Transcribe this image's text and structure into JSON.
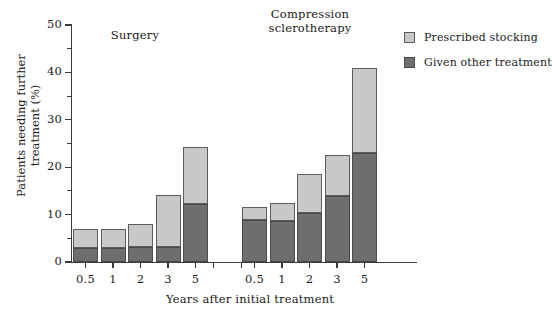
{
  "chart_data": {
    "type": "bar",
    "title": "",
    "subtitle": "",
    "xlabel": "Years after initial treatment",
    "ylabel": "Patients needing\nfurther treatment (%)",
    "ylim": [
      0,
      50
    ],
    "yticks_major": [
      0,
      10,
      20,
      30,
      40,
      50
    ],
    "yticks_minor": [
      5,
      15,
      25,
      35,
      45
    ],
    "grid": false,
    "stacked": true,
    "legend_position": "top-right",
    "legend": [
      {
        "name": "Prescribed stocking",
        "color": "#c8c8c8"
      },
      {
        "name": "Given other treatment",
        "color": "#6e6e6e"
      }
    ],
    "groups": [
      {
        "name": "Surgery",
        "caption": "Surgery",
        "categories": [
          "0.5",
          "1",
          "2",
          "3",
          "5"
        ],
        "series": [
          {
            "name": "Given other treatment",
            "values": [
              3.0,
              3.0,
              3.2,
              3.2,
              12.3
            ]
          },
          {
            "name": "Prescribed stocking",
            "values": [
              4.0,
              4.0,
              4.8,
              10.9,
              12.0
            ]
          }
        ],
        "totals": [
          7.0,
          7.0,
          8.0,
          14.1,
          24.3
        ]
      },
      {
        "name": "Compression sclerotherapy",
        "caption": "Compression\nsclerotherapy",
        "categories": [
          "0.5",
          "1",
          "2",
          "3",
          "5"
        ],
        "series": [
          {
            "name": "Given other treatment",
            "values": [
              8.9,
              8.6,
              10.3,
              13.9,
              23.0
            ]
          },
          {
            "name": "Prescribed stocking",
            "values": [
              2.7,
              3.8,
              8.2,
              8.7,
              18.0
            ]
          }
        ],
        "totals": [
          11.6,
          12.4,
          18.5,
          22.6,
          41.0
        ]
      }
    ]
  },
  "axis": {
    "y_title": "Patients needing\nfurther treatment (%)",
    "x_title": "Years after initial treatment",
    "y_labels": [
      "0",
      "10",
      "20",
      "30",
      "40",
      "50"
    ]
  },
  "colors": {
    "light_segment": "#c8c8c8",
    "dark_segment": "#6e6e6e",
    "axis": "#3a3a3a",
    "background": "#ffffff"
  }
}
